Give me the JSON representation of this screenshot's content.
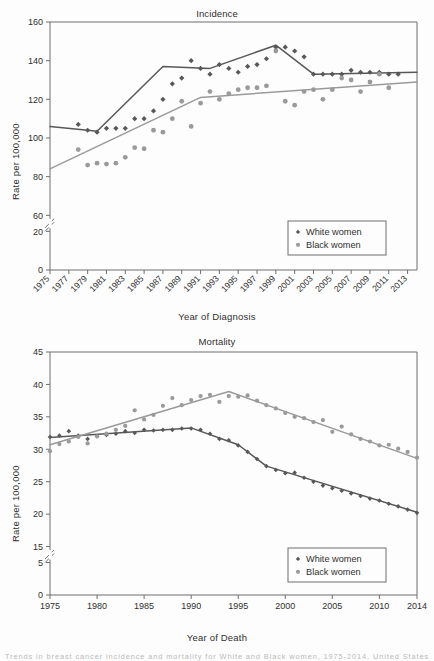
{
  "figure": {
    "caption_partial": "Trends in breast cancer incidence and mortality for White and Black women, 1975-2014, United States"
  },
  "colors": {
    "white_women": "#585858",
    "black_women": "#9a9a9a",
    "axis": "#6e6e6e",
    "text": "#2f2f2f",
    "background": "#fdfdfd"
  },
  "legend": {
    "white_women_label": "White women",
    "black_women_label": "Black women",
    "white_women_marker": "diamond-marker",
    "black_women_marker": "circle-marker"
  },
  "chart_data": [
    {
      "id": "incidence",
      "type": "scatter",
      "title": "Incidence",
      "xlabel": "Year of Diagnosis",
      "ylabel": "Rate per 100,000",
      "ylim": [
        0,
        160
      ],
      "xlim": [
        1975,
        2014
      ],
      "grid": false,
      "axis_break": {
        "between": [
          20,
          60
        ],
        "label_hidden": 40
      },
      "ytick_labels": [
        "0",
        "20",
        "60",
        "80",
        "100",
        "120",
        "140",
        "160"
      ],
      "yticks": [
        0,
        20,
        60,
        80,
        100,
        120,
        140,
        160
      ],
      "xtick_labels": [
        "1975",
        "1977",
        "1979",
        "1981",
        "1983",
        "1985",
        "1987",
        "1989",
        "1991",
        "1993",
        "1995",
        "1997",
        "1999",
        "2001",
        "2003",
        "2005",
        "2007",
        "2009",
        "2011",
        "2013"
      ],
      "xticks": [
        1975,
        1977,
        1979,
        1981,
        1983,
        1985,
        1987,
        1989,
        1991,
        1993,
        1995,
        1997,
        1999,
        2001,
        2003,
        2005,
        2007,
        2009,
        2011,
        2013
      ],
      "legend_position": "lower-right",
      "x": [
        1975,
        1976,
        1977,
        1978,
        1979,
        1980,
        1981,
        1982,
        1983,
        1984,
        1985,
        1986,
        1987,
        1988,
        1989,
        1990,
        1991,
        1992,
        1993,
        1994,
        1995,
        1996,
        1997,
        1998,
        1999,
        2000,
        2001,
        2002,
        2003,
        2004,
        2005,
        2006,
        2007,
        2008,
        2009,
        2010,
        2011,
        2012,
        2013,
        2014
      ],
      "series": [
        {
          "name": "White women",
          "marker": "diamond",
          "color": "#585858",
          "values": [
            null,
            null,
            null,
            107,
            104,
            103,
            105,
            105,
            105,
            110,
            110,
            114,
            120,
            128,
            131,
            140,
            136,
            133,
            138,
            136,
            134,
            137,
            138,
            141,
            147,
            147,
            145,
            142,
            133,
            133,
            133,
            133,
            135,
            134,
            134,
            134,
            133,
            133,
            null,
            null
          ],
          "trend": {
            "x": [
              1975,
              1979,
              1980,
              1987,
              1992,
              1999,
              2003,
              2014
            ],
            "y": [
              106,
              104,
              103.5,
              137,
              136,
              148,
              133,
              134
            ]
          }
        },
        {
          "name": "Black women",
          "marker": "circle",
          "color": "#9a9a9a",
          "values": [
            null,
            null,
            null,
            94,
            86,
            87,
            86.5,
            87,
            90,
            95,
            94.5,
            104,
            103,
            110,
            119,
            106,
            118,
            124,
            120,
            123,
            125,
            126,
            126,
            127,
            145,
            119,
            117,
            124,
            125,
            120,
            125,
            131,
            130,
            124,
            129,
            133,
            126,
            null,
            null,
            null
          ],
          "trend": {
            "x": [
              1975,
              1991,
              2014
            ],
            "y": [
              84,
              121,
              129
            ]
          }
        }
      ]
    },
    {
      "id": "mortality",
      "type": "scatter",
      "title": "Mortality",
      "xlabel": "Year of Death",
      "ylabel": "Rate per 100,000",
      "ylim": [
        0,
        45
      ],
      "xlim": [
        1975,
        2014
      ],
      "grid": false,
      "axis_break": {
        "between": [
          5,
          15
        ],
        "label_hidden": 10
      },
      "ytick_labels": [
        "0",
        "5",
        "15",
        "20",
        "25",
        "30",
        "35",
        "40",
        "45"
      ],
      "yticks": [
        0,
        5,
        15,
        20,
        25,
        30,
        35,
        40,
        45
      ],
      "xtick_labels": [
        "1975",
        "1980",
        "1985",
        "1990",
        "1995",
        "2000",
        "2005",
        "2010",
        "2014"
      ],
      "xticks": [
        1975,
        1980,
        1985,
        1990,
        1995,
        2000,
        2005,
        2010,
        2014
      ],
      "legend_position": "lower-right",
      "x": [
        1975,
        1976,
        1977,
        1978,
        1979,
        1980,
        1981,
        1982,
        1983,
        1984,
        1985,
        1986,
        1987,
        1988,
        1989,
        1990,
        1991,
        1992,
        1993,
        1994,
        1995,
        1996,
        1997,
        1998,
        1999,
        2000,
        2001,
        2002,
        2003,
        2004,
        2005,
        2006,
        2007,
        2008,
        2009,
        2010,
        2011,
        2012,
        2013,
        2014
      ],
      "series": [
        {
          "name": "White women",
          "marker": "diamond",
          "color": "#585858",
          "values": [
            31.9,
            32.1,
            32.8,
            32.1,
            31.6,
            32.0,
            32.2,
            32.4,
            32.8,
            32.5,
            33.0,
            32.9,
            33.0,
            33.0,
            33.2,
            33.2,
            33.0,
            32.4,
            31.6,
            31.4,
            30.6,
            29.6,
            28.5,
            27.4,
            26.8,
            26.3,
            26.4,
            25.6,
            25.0,
            24.4,
            24.0,
            23.6,
            23.2,
            22.8,
            22.4,
            22.1,
            21.6,
            21.2,
            20.7,
            20.2
          ],
          "trend": {
            "x": [
              1975,
              1990,
              1995,
              1998,
              2014
            ],
            "y": [
              31.8,
              33.3,
              30.7,
              27.4,
              20.3
            ]
          }
        },
        {
          "name": "Black women",
          "marker": "circle",
          "color": "#9a9a9a",
          "values": [
            29.7,
            30.8,
            31.2,
            31.9,
            30.9,
            32.0,
            32.4,
            33.0,
            33.6,
            36.0,
            34.6,
            35.3,
            36.7,
            37.9,
            36.8,
            37.6,
            38.2,
            38.4,
            37.3,
            38.2,
            38.1,
            38.3,
            37.5,
            36.8,
            36.3,
            35.6,
            35.0,
            34.8,
            34.2,
            34.5,
            32.7,
            33.5,
            32.3,
            31.6,
            31.2,
            30.6,
            30.7,
            30.1,
            29.6,
            28.7
          ],
          "trend": {
            "x": [
              1975,
              1994,
              2014
            ],
            "y": [
              30.7,
              38.9,
              28.6
            ]
          }
        }
      ]
    }
  ]
}
